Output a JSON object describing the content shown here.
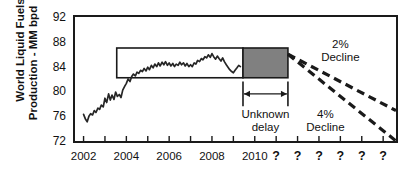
{
  "chart_data": {
    "type": "line",
    "title": "",
    "xlabel": "",
    "ylabel": "World Liquid Fuels Production - MM bpd",
    "ylabel_line1": "World Liquid Fuels",
    "ylabel_line2": "Production - MM bpd",
    "ylim": [
      72,
      92
    ],
    "yticks": [
      72,
      76,
      80,
      84,
      88,
      92
    ],
    "ytick_labels": [
      "72",
      "76",
      "80",
      "84",
      "88",
      "92"
    ],
    "xlim": [
      2001.6,
      2016.6
    ],
    "xticks": [
      2002,
      2003,
      2004,
      2005,
      2006,
      2007,
      2008,
      2009,
      2010,
      2011,
      2012,
      2013,
      2014,
      2015,
      2016
    ],
    "xtick_labels": [
      "2002",
      "2004",
      "2006",
      "2008",
      "2010"
    ],
    "xtick_label_years": [
      2002,
      2004,
      2006,
      2008,
      2010
    ],
    "x_unknown_labels": [
      "?",
      "?",
      "?",
      "?",
      "?",
      "?"
    ],
    "x_unknown_years": [
      2011,
      2012,
      2013,
      2014,
      2015,
      2016
    ],
    "grid": false,
    "legend": false,
    "series": [
      {
        "name": "World Liquid Fuels Production",
        "color": "#262626",
        "x": [
          2002.0,
          2002.08,
          2002.17,
          2002.25,
          2002.33,
          2002.42,
          2002.5,
          2002.58,
          2002.67,
          2002.75,
          2002.83,
          2002.92,
          2003.0,
          2003.08,
          2003.17,
          2003.25,
          2003.33,
          2003.42,
          2003.5,
          2003.58,
          2003.67,
          2003.75,
          2003.83,
          2003.92,
          2004.0,
          2004.08,
          2004.17,
          2004.25,
          2004.33,
          2004.42,
          2004.5,
          2004.58,
          2004.67,
          2004.75,
          2004.83,
          2004.92,
          2005.0,
          2005.08,
          2005.17,
          2005.25,
          2005.33,
          2005.42,
          2005.5,
          2005.58,
          2005.67,
          2005.75,
          2005.83,
          2005.92,
          2006.0,
          2006.08,
          2006.17,
          2006.25,
          2006.33,
          2006.42,
          2006.5,
          2006.58,
          2006.67,
          2006.75,
          2006.83,
          2006.92,
          2007.0,
          2007.08,
          2007.17,
          2007.25,
          2007.33,
          2007.42,
          2007.5,
          2007.58,
          2007.67,
          2007.75,
          2007.83,
          2007.92,
          2008.0,
          2008.08,
          2008.17,
          2008.25,
          2008.33,
          2008.42,
          2008.5,
          2008.58,
          2008.67,
          2008.75,
          2008.83,
          2008.92,
          2009.0,
          2009.08,
          2009.17,
          2009.25,
          2009.33
        ],
        "y": [
          76.3,
          75.6,
          75.1,
          76.0,
          76.4,
          76.2,
          76.9,
          76.6,
          77.3,
          77.1,
          77.8,
          77.5,
          78.9,
          78.2,
          79.6,
          78.6,
          79.4,
          78.7,
          79.9,
          79.2,
          79.5,
          79.0,
          80.2,
          80.8,
          81.3,
          82.0,
          81.6,
          82.4,
          82.8,
          82.5,
          83.1,
          82.9,
          83.4,
          83.2,
          83.7,
          83.3,
          83.9,
          83.5,
          84.2,
          83.8,
          84.4,
          84.0,
          84.6,
          84.1,
          84.7,
          84.3,
          84.8,
          84.2,
          84.6,
          84.1,
          84.5,
          84.0,
          84.4,
          84.2,
          84.7,
          84.3,
          84.6,
          84.1,
          84.5,
          84.0,
          84.3,
          84.0,
          84.6,
          84.4,
          85.0,
          84.8,
          85.3,
          85.1,
          85.6,
          85.4,
          85.9,
          85.5,
          86.1,
          85.6,
          85.2,
          85.7,
          85.3,
          84.9,
          85.4,
          84.8,
          84.3,
          83.9,
          83.5,
          83.2,
          83.0,
          83.4,
          83.8,
          84.2,
          84.0
        ]
      }
    ],
    "history_box": {
      "label": "historical-range-box",
      "x_start": 2003.55,
      "x_end": 2009.45,
      "y_top": 87.0,
      "y_bottom": 82.2,
      "fill": "#ffffff",
      "stroke": "#1a1a1a"
    },
    "plateau_box": {
      "label": "undulating-plateau-box",
      "x_start": 2009.45,
      "x_end": 2011.55,
      "y_top": 87.0,
      "y_bottom": 82.2,
      "fill": "#808080",
      "stroke": "#1a1a1a"
    },
    "decline_lines": [
      {
        "name": "2% Decline",
        "label_line1": "2%",
        "label_line2": "Decline",
        "x_start": 2011.55,
        "y_start": 86.0,
        "x_end": 2016.6,
        "y_end": 76.9,
        "style": "dashed",
        "color": "#1a1a1a"
      },
      {
        "name": "4% Decline",
        "label_line1": "4%",
        "label_line2": "Decline",
        "x_start": 2011.55,
        "y_start": 86.0,
        "x_end": 2016.6,
        "y_end": 72.0,
        "style": "dashed",
        "color": "#1a1a1a"
      }
    ],
    "unknown_delay": {
      "label_line1": "Unknown",
      "label_line2": "delay",
      "x_start": 2009.45,
      "x_end": 2011.55,
      "arrow_y": 79.6,
      "bracket_top": 81.6,
      "bracket_bottom": 77.6,
      "color": "#1a1a1a"
    },
    "colors": {
      "line": "#262626",
      "axis": "#1a1a1a",
      "plateau_fill": "#808080",
      "text": "#111111"
    }
  }
}
